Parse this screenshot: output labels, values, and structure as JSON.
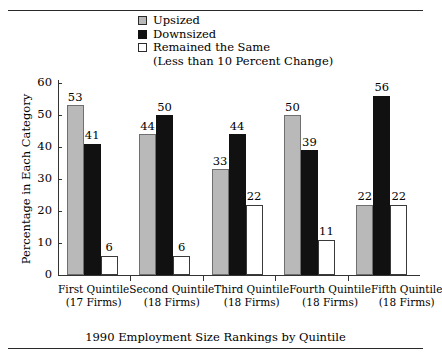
{
  "chart_data": {
    "type": "bar",
    "title": "",
    "xlabel": "1990 Employment Size Rankings by Quintile",
    "ylabel": "Percentage in Each Category",
    "ylim": [
      0,
      60
    ],
    "yticks": [
      0,
      10,
      20,
      30,
      40,
      50,
      60
    ],
    "grid": false,
    "legend_position": "top-center",
    "legend_note": "(Less than 10 Percent Change)",
    "categories": [
      "First Quintile",
      "Second Quintile",
      "Third Quintile",
      "Fourth Quintile",
      "Fifth Quintile"
    ],
    "category_sublabels": [
      "(17 Firms)",
      "(18 Firms)",
      "(18 Firms)",
      "(18 Firms)",
      "(18 Firms)"
    ],
    "series": [
      {
        "name": "Upsized",
        "color": "#b9b9b9",
        "values": [
          53,
          44,
          33,
          50,
          22
        ]
      },
      {
        "name": "Downsized",
        "color": "#111111",
        "values": [
          41,
          50,
          44,
          39,
          56
        ]
      },
      {
        "name": "Remained the Same",
        "color": "#ffffff",
        "values": [
          6,
          6,
          22,
          11,
          22
        ]
      }
    ]
  },
  "legend": {
    "items": [
      {
        "label": "Upsized",
        "swatch": "gray"
      },
      {
        "label": "Downsized",
        "swatch": "black"
      },
      {
        "label": "Remained the Same",
        "swatch": "white"
      }
    ],
    "sub_note": "(Less than 10 Percent Change)"
  },
  "axes": {
    "y_title": "Percentage in Each Category",
    "x_title": "1990 Employment Size Rankings by Quintile",
    "y_tick_labels": [
      "60",
      "50",
      "40",
      "30",
      "20",
      "10",
      "0"
    ]
  }
}
